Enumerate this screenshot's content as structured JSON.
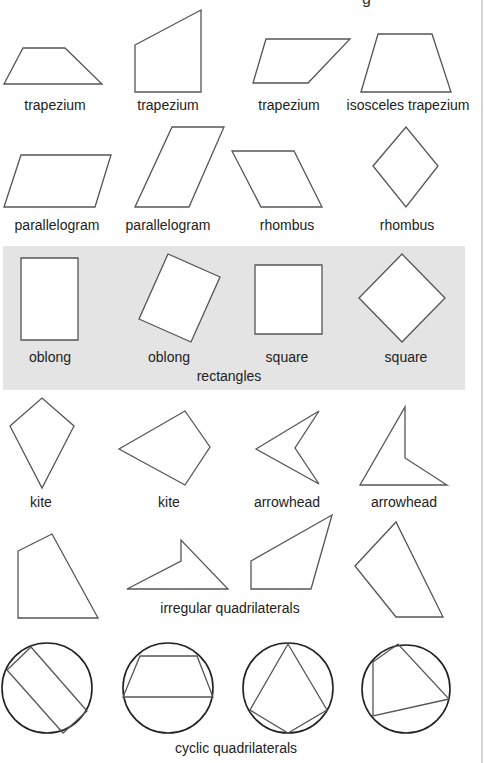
{
  "title_fragment": "g",
  "rows": [
    {
      "name": "trapeziums-row",
      "items": [
        {
          "label": "trapezium",
          "x": 55,
          "y": 97
        },
        {
          "label": "trapezium",
          "x": 168,
          "y": 97
        },
        {
          "label": "trapezium",
          "x": 289,
          "y": 97
        },
        {
          "label": "isosceles trapezium",
          "x": 408,
          "y": 97
        }
      ]
    },
    {
      "name": "parallelograms-row",
      "items": [
        {
          "label": "parallelogram",
          "x": 57,
          "y": 217
        },
        {
          "label": "parallelogram",
          "x": 168,
          "y": 217
        },
        {
          "label": "rhombus",
          "x": 287,
          "y": 217
        },
        {
          "label": "rhombus",
          "x": 407,
          "y": 217
        }
      ]
    },
    {
      "name": "rectangles-row",
      "group_label": "rectangles",
      "items": [
        {
          "label": "oblong",
          "x": 50,
          "y": 350
        },
        {
          "label": "oblong",
          "x": 169,
          "y": 350
        },
        {
          "label": "square",
          "x": 287,
          "y": 350
        },
        {
          "label": "square",
          "x": 406,
          "y": 350
        }
      ]
    },
    {
      "name": "kites-row",
      "items": [
        {
          "label": "kite",
          "x": 41,
          "y": 494
        },
        {
          "label": "kite",
          "x": 169,
          "y": 494
        },
        {
          "label": "arrowhead",
          "x": 287,
          "y": 494
        },
        {
          "label": "arrowhead",
          "x": 404,
          "y": 494
        }
      ]
    },
    {
      "name": "irregular-row",
      "group_label": "irregular quadrilaterals"
    },
    {
      "name": "cyclic-row",
      "group_label": "cyclic quadrilaterals"
    }
  ],
  "colors": {
    "stroke": "#555555",
    "circle_stroke": "#222222",
    "panel_bg": "#e4e4e4",
    "shape_fill_in_panel": "#ffffff"
  }
}
